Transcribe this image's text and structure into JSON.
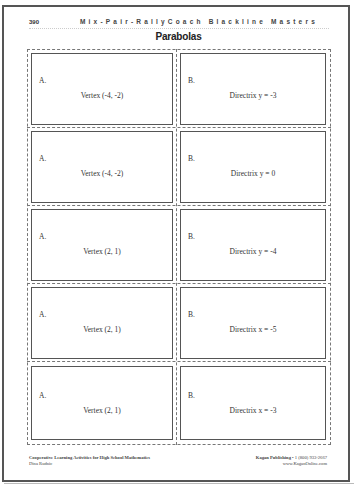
{
  "header": {
    "page_number": "390",
    "series_title": "Mix-Pair-RallyCoach Blackline Masters"
  },
  "title": "Parabolas",
  "cards": [
    {
      "left": {
        "letter": "A.",
        "text": "Vertex (-4, -2)"
      },
      "right": {
        "letter": "B.",
        "text": "Directrix y = -3"
      }
    },
    {
      "left": {
        "letter": "A.",
        "text": "Vertex (-4, -2)"
      },
      "right": {
        "letter": "B.",
        "text": "Directrix y = 0"
      }
    },
    {
      "left": {
        "letter": "A.",
        "text": "Vertex (2, 1)"
      },
      "right": {
        "letter": "B.",
        "text": "Directrix y = -4"
      }
    },
    {
      "left": {
        "letter": "A.",
        "text": "Vertex (2, 1)"
      },
      "right": {
        "letter": "B.",
        "text": "Directrix x = -5"
      }
    },
    {
      "left": {
        "letter": "A.",
        "text": "Vertex (2, 1)"
      },
      "right": {
        "letter": "B.",
        "text": "Directrix x = -3"
      }
    }
  ],
  "footer": {
    "book_title": "Cooperative Learning Activities for High School Mathematics",
    "author": "Dina Rudnic",
    "publisher": "Kagan Publishing",
    "phone": " • 1 (800) 933-2667",
    "website": "www.KaganOnline.com"
  }
}
